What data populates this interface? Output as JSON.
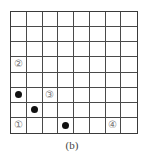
{
  "diagram": {
    "rows": 8,
    "cols": 8,
    "caption": "(b)",
    "labels": [
      {
        "row": 3,
        "col": 0,
        "text": "②"
      },
      {
        "row": 5,
        "col": 2,
        "text": "③"
      },
      {
        "row": 7,
        "col": 0,
        "text": "①"
      },
      {
        "row": 7,
        "col": 6,
        "text": "④"
      }
    ],
    "dots": [
      {
        "row": 5,
        "col": 0
      },
      {
        "row": 6,
        "col": 1
      },
      {
        "row": 7,
        "col": 3
      }
    ]
  }
}
